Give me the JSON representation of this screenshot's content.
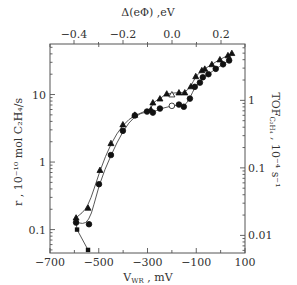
{
  "chart_data": {
    "type": "scatter",
    "title": "",
    "xlabel": "V_WR , mV",
    "ylabel": "r , 10^-10 mol C2H4/s",
    "y2label": "TOF_C2H4 , 10^-4 s^-1",
    "x2label": "Δ(eΦ) ,eV",
    "xlim": [
      -700,
      100
    ],
    "ylim": [
      0.045,
      56
    ],
    "yscale": "log",
    "y2scale": "log",
    "grid": false,
    "legend": "none",
    "x_ticks": [
      -700,
      -500,
      -300,
      -100,
      100
    ],
    "x_tick_labels": [
      "-700",
      "-500",
      "-300",
      "-100",
      "100"
    ],
    "y_ticks": [
      0.1,
      1,
      10
    ],
    "y_tick_labels": [
      "0.1",
      "1",
      "10"
    ],
    "x2_ticks": [
      -0.4,
      -0.2,
      0.0,
      0.2
    ],
    "x2_tick_labels": [
      "-0.4",
      "-0.2",
      "0.0",
      "0.2"
    ],
    "y2_ticks": [
      0.01,
      0.1,
      1
    ],
    "y2_tick_labels": [
      "0.01",
      "0.1",
      "1"
    ],
    "series": [
      {
        "name": "triangles (filled)",
        "marker": "triangle",
        "x": [
          -593,
          -544,
          -495,
          -450,
          -401,
          -352,
          -286,
          -278,
          -249,
          -221,
          -171,
          -147,
          -122,
          -102,
          -77,
          -65,
          -36,
          -3,
          30,
          46
        ],
        "y": [
          0.15,
          0.21,
          0.76,
          1.9,
          3.6,
          5.0,
          6.0,
          7.6,
          8.7,
          10.3,
          10.7,
          10.7,
          13.2,
          18.6,
          22.8,
          24,
          28,
          33,
          38,
          41
        ]
      },
      {
        "name": "circles (filled)",
        "marker": "circle",
        "x": [
          -593,
          -540,
          -499,
          -450,
          -401,
          -352,
          -302,
          -278,
          -249,
          -171,
          -151,
          -126,
          -106,
          -85,
          -73,
          -50,
          -20,
          10,
          35
        ],
        "y": [
          0.127,
          0.12,
          0.47,
          1.27,
          2.9,
          4.9,
          5.6,
          5.4,
          6.2,
          7.1,
          6.6,
          8.7,
          13,
          15,
          18,
          20,
          24,
          28,
          32
        ]
      },
      {
        "name": "open circle",
        "marker": "open-circle",
        "x": [
          -200
        ],
        "y": [
          6.8
        ]
      },
      {
        "name": "open triangle",
        "marker": "open-triangle",
        "x": [
          -200
        ],
        "y": [
          10
        ]
      },
      {
        "name": "squares",
        "marker": "square",
        "x": [
          -589,
          -544
        ],
        "y": [
          0.1,
          0.05
        ]
      }
    ]
  },
  "axes": {
    "top_title": "Δ(eΦ) ,eV",
    "bottom_title_main": "V",
    "bottom_title_sub": "WR",
    "bottom_title_unit": " ,  mV",
    "left_title": "r ,  10⁻¹⁰ mol C₂H₄/s",
    "right_title": "TOF",
    "right_title_sub": "C₂H₄",
    "right_title_unit": " ,  10⁻⁴ s⁻¹"
  }
}
